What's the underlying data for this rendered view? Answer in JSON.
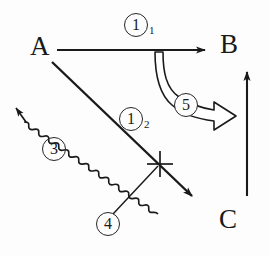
{
  "figure": {
    "type": "process-flow-diagram",
    "background_color": "#fdfdfd",
    "ink_color": "#1a1a1a",
    "width": 269,
    "height": 256
  },
  "nodes": [
    {
      "id": "A",
      "label": "A",
      "x": 30,
      "y": 33
    },
    {
      "id": "B",
      "label": "B",
      "x": 220,
      "y": 31
    },
    {
      "id": "C",
      "label": "C",
      "x": 219,
      "y": 206
    }
  ],
  "edges": [
    {
      "id": "edge-1-1",
      "label": "1",
      "subscript": "1",
      "from": "A",
      "to": "B",
      "style": "solid-straight-arrow",
      "orientation": "horizontal"
    },
    {
      "id": "edge-1-2",
      "label": "1",
      "subscript": "2",
      "from": "A",
      "to": "",
      "style": "solid-straight-arrow",
      "orientation": "diagonal-down-right"
    },
    {
      "id": "edge-3",
      "label": "3",
      "subscript": "",
      "from": "",
      "to": "",
      "style": "wavy-arrow",
      "orientation": "diagonal-up-left"
    },
    {
      "id": "edge-4",
      "label": "4",
      "subscript": "",
      "from": "",
      "to": "",
      "style": "leader-line",
      "orientation": "diagonal-up-right"
    },
    {
      "id": "edge-5",
      "label": "5",
      "subscript": "",
      "from": "B",
      "to": "C",
      "style": "hollow-block-curved-arrow",
      "orientation": "curve-down-right"
    },
    {
      "id": "edge-c-b",
      "label": "",
      "subscript": "",
      "from": "C",
      "to": "B",
      "style": "solid-straight-arrow",
      "orientation": "vertical-up"
    }
  ],
  "labels": {
    "node_a": "A",
    "node_b": "B",
    "node_c": "C",
    "circ_1_1": "1",
    "circ_1_1_sub": "1",
    "circ_1_2": "1",
    "circ_1_2_sub": "2",
    "circ_3": "3",
    "circ_4": "4",
    "circ_5": "5"
  },
  "markers": [
    {
      "id": "cross-mark",
      "name": "cross-intersection-mark",
      "x": 160,
      "y": 164
    }
  ]
}
